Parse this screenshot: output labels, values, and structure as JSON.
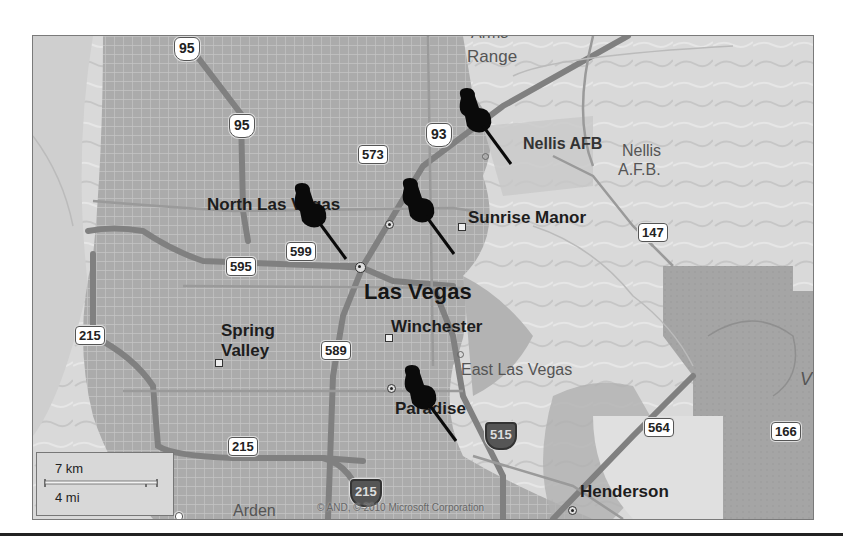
{
  "map": {
    "provider_copyright": "© AND, © 2010 Microsoft Corporation",
    "scale": {
      "metric": "7 km",
      "imperial": "4 mi"
    },
    "places": {
      "arms_range_partial": "Arms",
      "range": "Range",
      "nellis_afb": "Nellis AFB",
      "nellis_afb_2_line1": "Nellis",
      "nellis_afb_2_line2": "A.F.B.",
      "north_las_vegas": "North Las Vegas",
      "sunrise_manor": "Sunrise Manor",
      "las_vegas": "Las Vegas",
      "spring_valley_line1": "Spring",
      "spring_valley_line2": "Valley",
      "winchester": "Winchester",
      "east_las_vegas": "East Las Vegas",
      "paradise": "Paradise",
      "henderson": "Henderson",
      "arden": "Arden",
      "right_edge_partial": "V"
    },
    "road_shields": [
      {
        "id": "95-north",
        "label": "95",
        "type": "us"
      },
      {
        "id": "95-south",
        "label": "95",
        "type": "us"
      },
      {
        "id": "93",
        "label": "93",
        "type": "us"
      },
      {
        "id": "573",
        "label": "573",
        "type": "state"
      },
      {
        "id": "599",
        "label": "599",
        "type": "state"
      },
      {
        "id": "595",
        "label": "595",
        "type": "state"
      },
      {
        "id": "589",
        "label": "589",
        "type": "state"
      },
      {
        "id": "147",
        "label": "147",
        "type": "state"
      },
      {
        "id": "215-west",
        "label": "215",
        "type": "state"
      },
      {
        "id": "215-south",
        "label": "215",
        "type": "state"
      },
      {
        "id": "215-interstate",
        "label": "215",
        "type": "interstate"
      },
      {
        "id": "515",
        "label": "515",
        "type": "interstate"
      },
      {
        "id": "564",
        "label": "564",
        "type": "state"
      },
      {
        "id": "166",
        "label": "166",
        "type": "state"
      },
      {
        "id": "159-partial",
        "label": "159",
        "type": "state"
      }
    ],
    "pushpins": [
      {
        "id": "pin-nellis",
        "near": "Nellis AFB"
      },
      {
        "id": "pin-north-las-vegas",
        "near": "North Las Vegas"
      },
      {
        "id": "pin-sunrise-manor",
        "near": "Sunrise Manor"
      },
      {
        "id": "pin-paradise",
        "near": "Paradise"
      }
    ],
    "colors": {
      "urban": "#a9a9a9",
      "terrain": "#d6d6d6",
      "federal_land": "#a0a0a0",
      "road": "#8a8a8a",
      "pin": "#0a0a0a"
    }
  }
}
